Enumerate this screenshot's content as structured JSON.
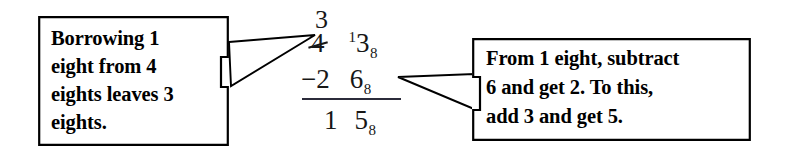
{
  "figure": {
    "kind": "annotated-arithmetic-diagram",
    "topic": "Octal (base 8) subtraction with borrowing",
    "background_color": "#ffffff",
    "ink_color": "#000000"
  },
  "callouts": {
    "left": {
      "text": "Borrowing 1\neight from 4\neights leaves 3\neights.",
      "lines": [
        "Borrowing 1",
        "eight from 4",
        "eights leaves 3",
        "eights."
      ],
      "points_to": "struck-out 4 in the eights column"
    },
    "right": {
      "text": "From 1 eight, subtract\n6 and get 2. To this,\nadd 3 and get 5.",
      "lines": [
        "From 1 eight, subtract",
        "6 and get 2. To this,",
        "add 3 and get 5."
      ],
      "points_to": "subtrahend ones digit 6 with base-8 subscript"
    }
  },
  "arithmetic": {
    "base_subscript": "8",
    "borrow_mark": "3",
    "minuend": {
      "eights_digit_original": "4",
      "eights_digit_struck": true,
      "ones_carry_superscript": "1",
      "ones_digit": "3",
      "subscript": "8",
      "display": "4 ¹3₈"
    },
    "subtrahend": {
      "operator": "−",
      "eights_digit": "2",
      "ones_digit": "6",
      "subscript": "8",
      "display": "−2  6₈"
    },
    "answer": {
      "eights_digit": "1",
      "ones_digit": "5",
      "subscript": "8",
      "display": "1  5₈"
    }
  }
}
